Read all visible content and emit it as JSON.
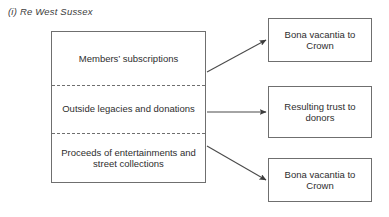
{
  "figure": {
    "caption": "(i) Re West Sussex"
  },
  "diagram": {
    "sources": [
      {
        "label": "Members’ subscriptions"
      },
      {
        "label": "Outside legacies and donations"
      },
      {
        "label": "Proceeds of entertainments and street collections"
      }
    ],
    "outcomes": [
      {
        "label": "Bona vacantia to Crown"
      },
      {
        "label": "Resulting trust to donors"
      },
      {
        "label": "Bona vacantia to Crown"
      }
    ],
    "connectors": [
      {
        "name": "arrow-subscriptions-to-bona-vacantia",
        "from": "source-1",
        "to": "outcome-1"
      },
      {
        "name": "arrow-legacies-to-resulting-trust",
        "from": "source-2",
        "to": "outcome-2"
      },
      {
        "name": "arrow-entertainments-to-bona-vacantia",
        "from": "source-3",
        "to": "outcome-3"
      }
    ],
    "colors": {
      "stroke": "#6f6f6f",
      "arrow": "#4a4a4a",
      "text": "#2e2e2e",
      "caption": "#3b3b3b",
      "background": "#ffffff"
    }
  }
}
